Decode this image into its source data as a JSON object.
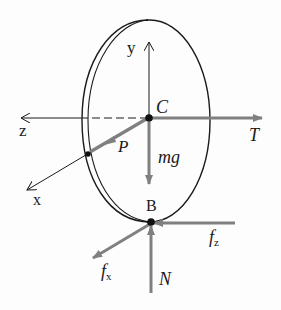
{
  "diagram": {
    "type": "free-body diagram of a rolling disk",
    "colors": {
      "ink": "#1a1a1a",
      "force_arrow": "#808080",
      "background": "#fdfdfd"
    },
    "points": [
      {
        "id": "C",
        "label": "C",
        "description": "center of mass"
      },
      {
        "id": "B",
        "label": "B",
        "description": "contact point with ground"
      },
      {
        "id": "P",
        "label": "P",
        "description": "point on rim"
      }
    ],
    "axes": [
      {
        "id": "x",
        "label": "x"
      },
      {
        "id": "y",
        "label": "y"
      },
      {
        "id": "z",
        "label": "z"
      }
    ],
    "forces": [
      {
        "id": "T",
        "label": "T",
        "direction": "+ horizontal right from C"
      },
      {
        "id": "mg",
        "label": "mg",
        "direction": "down from C"
      },
      {
        "id": "N",
        "label": "N",
        "direction": "up into B"
      },
      {
        "id": "fz",
        "label": "f",
        "subscript": "z",
        "direction": "left into B"
      },
      {
        "id": "fx",
        "label": "f",
        "subscript": "x",
        "direction": "down-left from B"
      }
    ],
    "vectors": [
      {
        "id": "P",
        "label": "P",
        "description": "position vector from C to rim point"
      }
    ]
  }
}
